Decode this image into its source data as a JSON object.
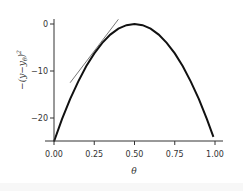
{
  "chart_data": {
    "type": "line",
    "title": "",
    "xlabel": "θ",
    "ylabel": "−(y−y_θ)²",
    "xlim": [
      0,
      1
    ],
    "ylim": [
      -25,
      1
    ],
    "grid": false,
    "legend": null,
    "x_ticks": [
      "0.00",
      "0.25",
      "0.50",
      "0.75",
      "1.00"
    ],
    "y_ticks": [
      "0",
      "−10",
      "−20"
    ],
    "series": [
      {
        "name": "curve",
        "style": "thick black line",
        "x": [
          0.0,
          0.05,
          0.1,
          0.15,
          0.2,
          0.25,
          0.3,
          0.35,
          0.4,
          0.45,
          0.5,
          0.55,
          0.6,
          0.65,
          0.7,
          0.75,
          0.8,
          0.85,
          0.9,
          0.95,
          0.99
        ],
        "y": [
          -25.0,
          -20.25,
          -16.0,
          -12.25,
          -9.0,
          -6.25,
          -4.0,
          -2.25,
          -1.0,
          -0.25,
          0.0,
          -0.25,
          -1.0,
          -2.25,
          -4.0,
          -6.25,
          -9.0,
          -12.25,
          -16.0,
          -20.25,
          -24.0
        ]
      },
      {
        "name": "tangent",
        "style": "thin gray line",
        "x": [
          0.1,
          0.4
        ],
        "y": [
          -12.5,
          1.0
        ]
      }
    ]
  },
  "axes": {
    "x_label": "θ",
    "y_label_parts": [
      "−(",
      "y",
      "−",
      "y",
      "θ",
      ")",
      "2"
    ]
  }
}
